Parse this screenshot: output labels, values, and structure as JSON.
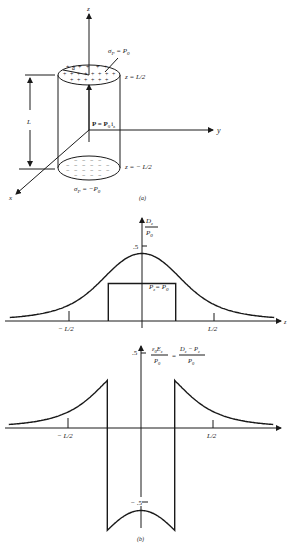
{
  "figure": {
    "part_a": {
      "caption": "(a)",
      "axis_z": "z",
      "axis_y": "y",
      "axis_x": "x",
      "radius_label": "a",
      "top_charge_label": "σ",
      "top_charge_sub": "P",
      "top_charge_eq": " = P",
      "top_charge_eq_sub": "0",
      "top_plane_label": "z = L/2",
      "bottom_plane_label": "z = − L/2",
      "bottom_charge_label": "σ",
      "bottom_charge_sub": "P",
      "bottom_charge_eq": " = −P",
      "bottom_charge_eq_sub": "0",
      "length_label": "L",
      "polarization_label": "P = P",
      "polarization_sub": "0",
      "polarization_unit": "i",
      "polarization_unit_sub": "z",
      "top_surface_sign": "+",
      "bottom_surface_sign": "−"
    },
    "part_b": {
      "caption": "(b)"
    }
  },
  "chart_data": [
    {
      "type": "line",
      "title": "",
      "ylabel_num": "D",
      "ylabel_num_sub": "z",
      "ylabel_den": "P",
      "ylabel_den_sub": "0",
      "xlabel": "z",
      "x_ticks": [
        "− L/2",
        "L/2"
      ],
      "y_ticks": [
        ".5"
      ],
      "annotation": "P",
      "annotation_sub": "z",
      "annotation_eq": "= P",
      "annotation_eq_sub": "0",
      "series": [
        {
          "name": "D_z/P_0",
          "x": [
            -1.0,
            -0.75,
            -0.5,
            -0.25,
            0,
            0.25,
            0.5,
            0.75,
            1.0
          ],
          "values": [
            0.09,
            0.18,
            0.32,
            0.43,
            0.45,
            0.43,
            0.32,
            0.18,
            0.09
          ]
        },
        {
          "name": "P_z/P_0",
          "x": [
            -0.25,
            -0.25,
            0.25,
            0.25
          ],
          "values": [
            0,
            0.25,
            0.25,
            0
          ]
        }
      ],
      "xlim": [
        -1.0,
        1.0
      ],
      "ylim": [
        0,
        0.5
      ]
    },
    {
      "type": "line",
      "title": "",
      "ylabel_left_num": "ε",
      "ylabel_left_num_sub": "0",
      "ylabel_left_num2": "E",
      "ylabel_left_num2_sub": "z",
      "ylabel_den": "P",
      "ylabel_den_sub": "0",
      "ylabel_right_num": "D",
      "ylabel_right_num_sub": "z",
      "ylabel_right_minus": " − P",
      "ylabel_right_minus_sub": "z",
      "equals": "=",
      "xlabel": "z",
      "x_ticks": [
        "− L/2",
        "L/2"
      ],
      "y_ticks": [
        ".5",
        "− .5"
      ],
      "series": [
        {
          "name": "eps0_Ez/P_0",
          "x": [
            -1.0,
            -0.75,
            -0.5,
            -0.25,
            -0.25,
            0,
            0.25,
            0.25,
            0.5,
            0.75,
            1.0
          ],
          "values": [
            0.09,
            0.18,
            0.32,
            0.43,
            -0.57,
            -0.55,
            -0.57,
            0.43,
            0.32,
            0.18,
            0.09
          ]
        }
      ],
      "xlim": [
        -1.0,
        1.0
      ],
      "ylim": [
        -0.6,
        0.5
      ]
    }
  ]
}
